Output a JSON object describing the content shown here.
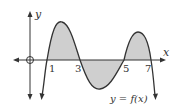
{
  "diagram": {
    "axis_labels": {
      "x": "x",
      "y": "y"
    },
    "tick_labels": [
      "1",
      "3",
      "5",
      "7"
    ],
    "curve_label": "y = f(x)",
    "colors": {
      "stroke": "#333333",
      "shade": "#cfcfcf",
      "background": "#ffffff"
    }
  }
}
